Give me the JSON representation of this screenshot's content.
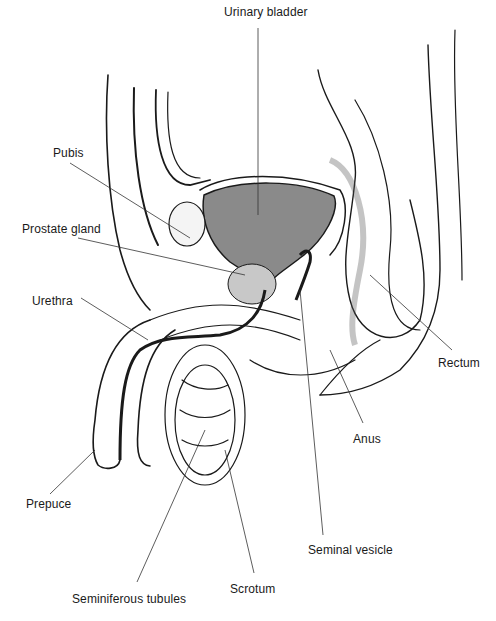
{
  "figure": {
    "colors": {
      "line": "#1a1a1a",
      "bladder_fill": "#8a8a8a",
      "prostate_fill": "#c8c8c8",
      "background": "#ffffff"
    },
    "labels": [
      {
        "id": "urinary-bladder",
        "text": "Urinary bladder",
        "x": 224,
        "y": 12
      },
      {
        "id": "pubis",
        "text": "Pubis",
        "x": 53,
        "y": 146
      },
      {
        "id": "prostate-gland",
        "text": "Prostate gland",
        "x": 22,
        "y": 222
      },
      {
        "id": "urethra",
        "text": "Urethra",
        "x": 32,
        "y": 294
      },
      {
        "id": "rectum",
        "text": "Rectum",
        "x": 438,
        "y": 356
      },
      {
        "id": "anus",
        "text": "Anus",
        "x": 353,
        "y": 432
      },
      {
        "id": "prepuce",
        "text": "Prepuce",
        "x": 26,
        "y": 497
      },
      {
        "id": "seminal-vesicle",
        "text": "Seminal vesicle",
        "x": 308,
        "y": 543
      },
      {
        "id": "scrotum",
        "text": "Scrotum",
        "x": 230,
        "y": 582
      },
      {
        "id": "seminiferous-tubules",
        "text": "Seminiferous tubules",
        "x": 72,
        "y": 592
      }
    ]
  }
}
